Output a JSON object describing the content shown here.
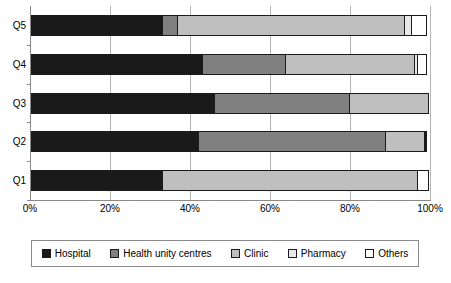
{
  "chart_data": {
    "type": "bar",
    "orientation": "horizontal",
    "stacked": true,
    "normalized": true,
    "title": "",
    "subtitle": "",
    "xlabel": "",
    "ylabel": "",
    "xlim": [
      0,
      100
    ],
    "xticks": [
      0,
      20,
      40,
      60,
      80,
      100
    ],
    "xticklabels": [
      "0%",
      "20%",
      "40%",
      "60%",
      "80%",
      "100%"
    ],
    "grid": true,
    "grid_axis": "x",
    "legend_position": "bottom",
    "categories": [
      "Q1",
      "Q2",
      "Q3",
      "Q4",
      "Q5"
    ],
    "category_order_top_to_bottom": [
      "Q5",
      "Q4",
      "Q3",
      "Q2",
      "Q1"
    ],
    "series": [
      {
        "name": "Hospital",
        "color": "#1a1a1a",
        "values": [
          33,
          42,
          46,
          43,
          33
        ]
      },
      {
        "name": "Health unity centres",
        "color": "#808080",
        "values": [
          0,
          47,
          34,
          21,
          4
        ]
      },
      {
        "name": "Clinic",
        "color": "#bfbfbf",
        "values": [
          64,
          10,
          20,
          32.5,
          57
        ]
      },
      {
        "name": "Pharmacy",
        "color": "#e8e8e8",
        "values": [
          0,
          0.5,
          0,
          1,
          2
        ]
      },
      {
        "name": "Others",
        "color": "#ffffff",
        "values": [
          3,
          0.5,
          0,
          2.5,
          4
        ]
      }
    ]
  },
  "axis": {
    "ticklabels": [
      "0%",
      "20%",
      "40%",
      "60%",
      "80%",
      "100%"
    ],
    "categories": [
      "Q5",
      "Q4",
      "Q3",
      "Q2",
      "Q1"
    ]
  },
  "legend": {
    "items": [
      {
        "label": "Hospital",
        "swatch": "hospital"
      },
      {
        "label": "Health unity centres",
        "swatch": "health-unity"
      },
      {
        "label": "Clinic",
        "swatch": "clinic"
      },
      {
        "label": "Pharmacy",
        "swatch": "pharmacy"
      },
      {
        "label": "Others",
        "swatch": "others"
      }
    ]
  }
}
